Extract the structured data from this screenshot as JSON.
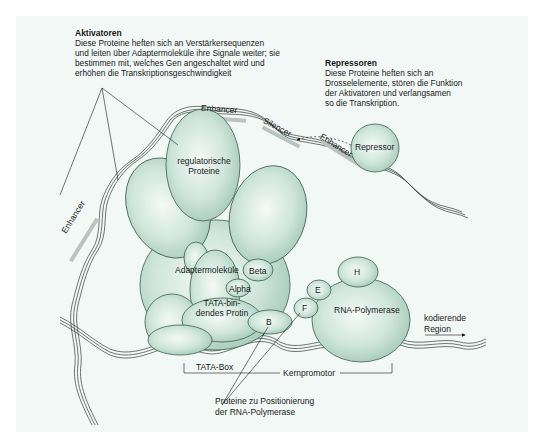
{
  "colors": {
    "background": "#f1f8f6",
    "protein_fill": "#c9e1d7",
    "protein_stroke": "#3d5e50",
    "dna_stroke": "#2f3f38",
    "text": "#1a1a1a"
  },
  "activators": {
    "title": "Aktivatoren",
    "lines": [
      "Diese Proteine heften sich an Verstärkersequenzen",
      "und leiten über Adaptermoleküle ihre Signale weiter; sie",
      "bestimmen mit, welches Gen angeschaltet wird und",
      "erhöhen die Transkriptionsgeschwindigkeit"
    ]
  },
  "repressors": {
    "title": "Repressoren",
    "lines": [
      "Diese Proteine heften sich an",
      "Drosselelemente, stören die Funktion",
      "der Aktivatoren und verlangsamen",
      "so die Transkription."
    ]
  },
  "dna_elements": {
    "enhancer_top": "Enhancer",
    "enhancer_left": "Enhancer",
    "enhancer_right": "Enhancer",
    "silencer": "Silencer"
  },
  "proteins": {
    "repressor": "Repressor",
    "regulatory_line1": "regulatorische",
    "regulatory_line2": "Proteine",
    "adapter": "Adaptermoleküle",
    "beta": "Beta",
    "alpha": "Alpha",
    "tata_line1": "TATA-bin-",
    "tata_line2": "dendes Protin",
    "b": "B",
    "f": "F",
    "e": "E",
    "h": "H",
    "rna_polymerase": "RNA-Polymerase"
  },
  "annotations": {
    "coding_line1": "kodierende",
    "coding_line2": "Region",
    "tata_box": "TATA-Box",
    "core_promoter": "Kernpromotor",
    "positioning_line1": "Proteine zu Positionierung",
    "positioning_line2": "der RNA-Polymerase"
  }
}
